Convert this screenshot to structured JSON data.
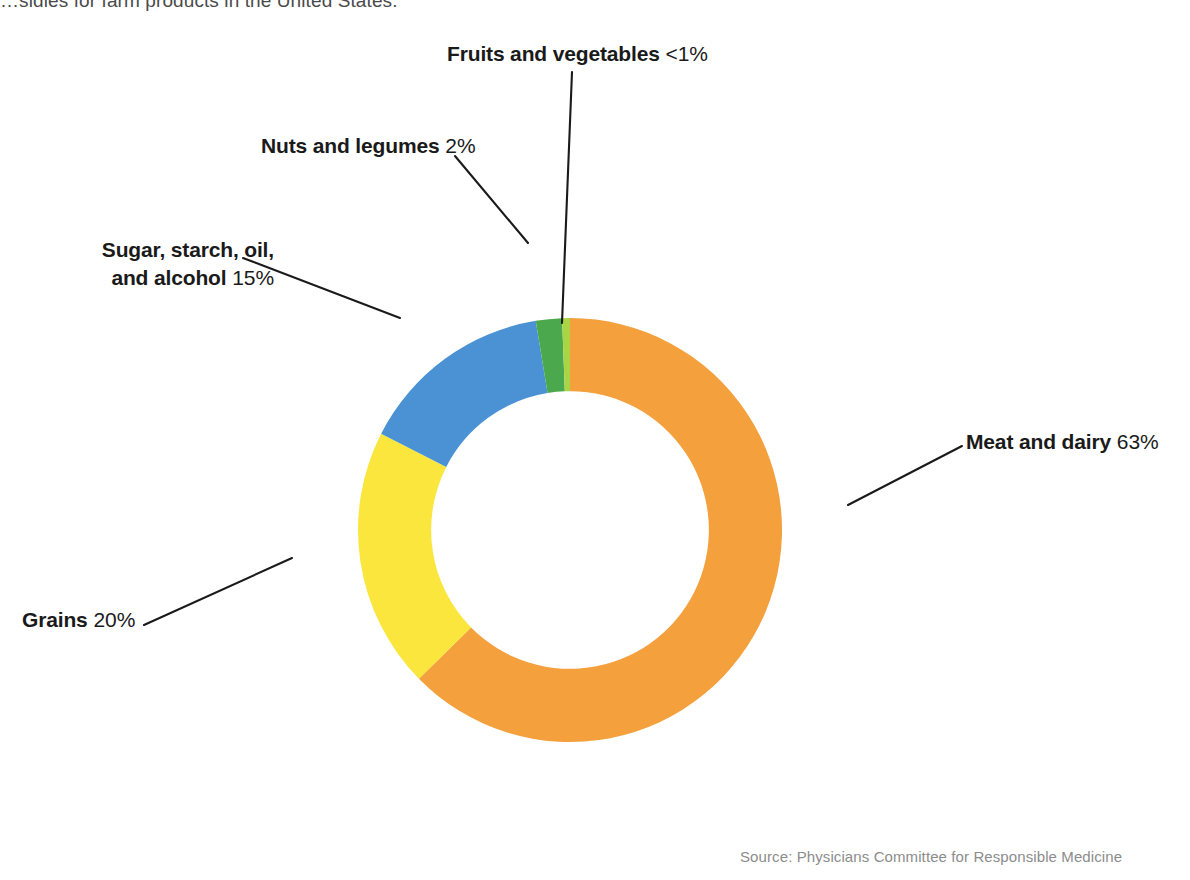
{
  "caption": {
    "text": "…sidies for farm products in the United States."
  },
  "source": {
    "text": "Source: Physicians Committee for Responsible Medicine"
  },
  "labels": {
    "fruits": {
      "name": "Fruits and vegetables",
      "value": "<1%"
    },
    "nuts": {
      "name": "Nuts and legumes",
      "value": "2%"
    },
    "sugar": {
      "name_line1": "Sugar, starch, oil,",
      "name_line2": "and alcohol",
      "value": "15%"
    },
    "grains": {
      "name": "Grains",
      "value": "20%"
    },
    "meat": {
      "name": "Meat and dairy",
      "value": "63%"
    }
  },
  "chart_data": {
    "type": "pie",
    "variant": "donut",
    "xlabel": "",
    "ylabel": "",
    "unit": "percent",
    "start_angle_deg": 0,
    "direction": "clockwise",
    "inner_radius_ratio": 0.655,
    "legend_position": "callout-labels",
    "grid": false,
    "categories": [
      "Meat and dairy",
      "Grains",
      "Sugar, starch, oil, and alcohol",
      "Nuts and legumes",
      "Fruits and vegetables"
    ],
    "values": [
      63,
      20,
      15,
      2,
      0.6
    ],
    "value_labels": [
      "63%",
      "20%",
      "15%",
      "2%",
      "<1%"
    ],
    "colors": [
      "#F4A03C",
      "#FAE63C",
      "#4A92D3",
      "#4CA84C",
      "#A9D444"
    ],
    "series": [
      {
        "name": "Share of farm subsidies",
        "values": [
          63,
          20,
          15,
          2,
          0.6
        ]
      }
    ]
  },
  "colors": {
    "meat": "#F4A03C",
    "grains": "#FAE63C",
    "sugar": "#4A92D3",
    "nuts": "#4CA84C",
    "fruits": "#A9D444",
    "leader": "#1a1a1a",
    "text": "#1a1a1a",
    "caption": "#4a4a4a",
    "source": "#8c8c8c"
  }
}
